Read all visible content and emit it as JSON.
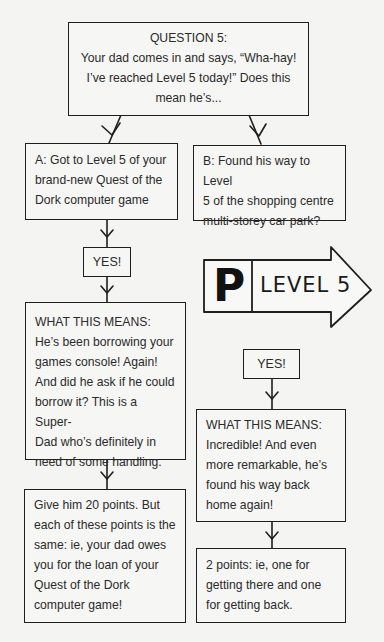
{
  "question": {
    "title": "QUESTION 5:",
    "lines": [
      "Your dad comes in and says, “Wha-hay!",
      "I’ve reached Level 5 today!” Does this",
      "mean he’s..."
    ]
  },
  "option_a": {
    "lines": [
      "A: Got to Level 5 of your",
      "brand-new Quest of the",
      "Dork computer game"
    ],
    "yes_label": "YES!",
    "means": {
      "title": "WHAT THIS MEANS:",
      "lines": [
        "He’s been borrowing your",
        "games console! Again!",
        "And did he ask if he could",
        "borrow it? This is a Super-",
        "Dad who’s definitely in",
        "need of some handling."
      ]
    },
    "points": {
      "lines": [
        "Give him 20 points. But",
        "each of these points is the",
        "same: ie, your dad owes",
        "you for the loan of your",
        "Quest of the Dork",
        "computer game!"
      ]
    }
  },
  "option_b": {
    "lines": [
      "B: Found his way to Level",
      "5 of the shopping centre",
      "multi-storey car park?"
    ],
    "sign": {
      "letter": "P",
      "label": "LEVEL 5"
    },
    "yes_label": "YES!",
    "means": {
      "title": "WHAT THIS MEANS:",
      "lines": [
        "Incredible! And even",
        "more remarkable, he’s",
        "found his way back",
        "home again!"
      ]
    },
    "points": {
      "lines": [
        "2 points: ie, one for",
        "getting there and one",
        "for getting back."
      ]
    }
  }
}
